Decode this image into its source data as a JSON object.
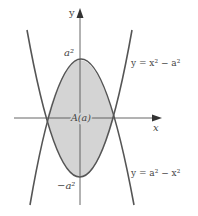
{
  "diagram": {
    "axes": {
      "x_label": "x",
      "y_label": "y"
    },
    "labels": {
      "top_value": "a²",
      "bottom_value": "−a²",
      "region": "A(a)",
      "curve_upper": "y = x² − a²",
      "curve_lower": "y = a² − x²"
    },
    "curves": [
      {
        "name": "y = x² − a²",
        "opens": "up",
        "vertex_y": "−a²"
      },
      {
        "name": "y = a² − x²",
        "opens": "down",
        "vertex_y": "a²"
      }
    ],
    "shaded_region": "A(a)",
    "colors": {
      "fill": "#d4d4d4",
      "curve": "#555555",
      "axis": "#555555",
      "text": "#444444"
    }
  }
}
